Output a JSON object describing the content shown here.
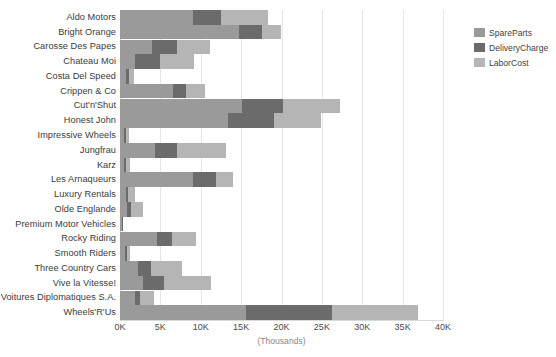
{
  "chart_data": {
    "type": "bar",
    "orientation": "horizontal",
    "stacked": true,
    "title": "",
    "subtitle": "",
    "xlabel": "(Thousands)",
    "ylabel": "",
    "xlim": [
      0,
      40000
    ],
    "xticks": [
      0,
      5000,
      10000,
      15000,
      20000,
      25000,
      30000,
      35000,
      40000
    ],
    "xtick_labels": [
      "0K",
      "5K",
      "10K",
      "15K",
      "20K",
      "25K",
      "30K",
      "35K",
      "40K"
    ],
    "grid": true,
    "grid_axis": "x",
    "legend_position": "right",
    "categories": [
      "Aldo Motors",
      "Bright Orange",
      "Carosse Des Papes",
      "Chateau Moi",
      "Costa Del Speed",
      "Crippen & Co",
      "Cut'n'Shut",
      "Honest John",
      "Impressive Wheels",
      "Jungfrau",
      "Karz",
      "Les Arnaqueurs",
      "Luxury Rentals",
      "Olde Englande",
      "Premium Motor Vehicles",
      "Rocky Riding",
      "Smooth Riders",
      "Three Country Cars",
      "Vive la Vitesse!",
      "Voitures Diplomatiques S.A.",
      "Wheels'R'Us"
    ],
    "series": [
      {
        "name": "SpareParts",
        "color": "#9a9a9a",
        "values": [
          9100,
          14700,
          4000,
          1800,
          800,
          6600,
          15100,
          13400,
          500,
          4300,
          500,
          9100,
          700,
          900,
          300,
          4600,
          600,
          2200,
          2800,
          1800,
          15600
        ]
      },
      {
        "name": "DeliveryCharge",
        "color": "#6b6b6b",
        "values": [
          3400,
          2900,
          3100,
          3100,
          300,
          1600,
          5100,
          5700,
          300,
          2700,
          300,
          2800,
          300,
          500,
          100,
          1800,
          300,
          1700,
          2700,
          700,
          10700
        ]
      },
      {
        "name": "LaborCost",
        "color": "#b5b5b5",
        "values": [
          5800,
          2400,
          4000,
          4300,
          600,
          2300,
          7000,
          5800,
          300,
          6100,
          400,
          2100,
          800,
          1400,
          0,
          3000,
          400,
          3800,
          5800,
          1700,
          10600
        ]
      }
    ],
    "totals": [
      18300,
      20000,
      11100,
      9200,
      1700,
      10500,
      27200,
      24900,
      1100,
      13100,
      1200,
      14000,
      1800,
      2800,
      400,
      9400,
      1300,
      7700,
      11300,
      4200,
      36900
    ]
  },
  "legend": {
    "items": [
      {
        "label": "SpareParts",
        "color": "#9a9a9a"
      },
      {
        "label": "DeliveryCharge",
        "color": "#6b6b6b"
      },
      {
        "label": "LaborCost",
        "color": "#b5b5b5"
      }
    ]
  },
  "colors": {
    "background": "#ffffff",
    "gridline": "#e6e6e6",
    "axis_line": "#d9d9d9",
    "label_text": "#3b3b3b",
    "tick_text": "#4a4a4a",
    "axis_title_text": "#8a8a8a"
  }
}
